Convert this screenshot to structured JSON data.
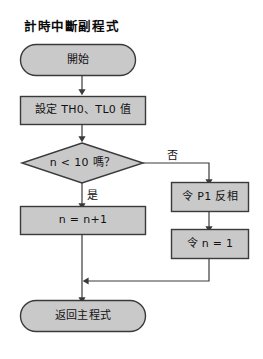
{
  "diagram": {
    "title": "計時中斷副程式",
    "colors": {
      "shape_fill": "#c9c9c9",
      "shape_stroke": "#3a3a3a",
      "connector": "#3a3a3a",
      "text": "#111111",
      "background": "#ffffff"
    },
    "nodes": [
      {
        "id": "start",
        "type": "terminator",
        "label": "開始"
      },
      {
        "id": "set_timer",
        "type": "process",
        "label": "設定 TH0、TL0 值"
      },
      {
        "id": "decision",
        "type": "decision",
        "label": "n < 10 嗎？"
      },
      {
        "id": "inc_n",
        "type": "process",
        "label": "n = n+1"
      },
      {
        "id": "invert_p1",
        "type": "process",
        "label": "令 P1 反相"
      },
      {
        "id": "reset_n",
        "type": "process",
        "label": "令 n = 1"
      },
      {
        "id": "return",
        "type": "terminator",
        "label": "返回主程式"
      }
    ],
    "edge_labels": {
      "yes": "是",
      "no": "否"
    },
    "edges": [
      {
        "from": "start",
        "to": "set_timer",
        "label": ""
      },
      {
        "from": "set_timer",
        "to": "decision",
        "label": ""
      },
      {
        "from": "decision",
        "to": "inc_n",
        "label": "是"
      },
      {
        "from": "decision",
        "to": "invert_p1",
        "label": "否"
      },
      {
        "from": "invert_p1",
        "to": "reset_n",
        "label": ""
      },
      {
        "from": "inc_n",
        "to": "return",
        "label": ""
      },
      {
        "from": "reset_n",
        "to": "return",
        "label": ""
      }
    ]
  }
}
